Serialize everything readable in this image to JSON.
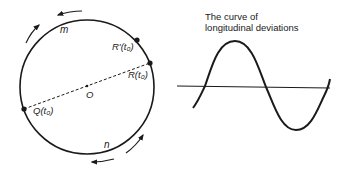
{
  "figure": {
    "circle": {
      "center": {
        "x": 87,
        "y": 87
      },
      "radius": 67,
      "center_label": "O",
      "upper_arc_label": "m",
      "lower_arc_label": "n",
      "points": [
        {
          "id": "R_prime",
          "label": "R'(t₀)",
          "x": 137,
          "y": 40
        },
        {
          "id": "R",
          "label": "R(t₀)",
          "x": 150,
          "y": 63
        },
        {
          "id": "Q",
          "label": "Q(t₀)",
          "x": 24,
          "y": 109
        }
      ],
      "diameter": {
        "from": "Q",
        "to": "R",
        "style": "dashed"
      },
      "arrows": [
        {
          "location": "upper-left",
          "direction": "counterclockwise"
        },
        {
          "location": "top",
          "direction": "counterclockwise"
        },
        {
          "location": "lower-right",
          "direction": "counterclockwise"
        },
        {
          "location": "bottom",
          "direction": "counterclockwise"
        }
      ]
    },
    "curve": {
      "title_line1": "The curve of",
      "title_line2": "longitudinal deviations",
      "axis": {
        "x1": 177,
        "x2": 330,
        "y": 87
      },
      "shape": "sine",
      "peak_y": 41,
      "trough_y": 130
    }
  },
  "colors": {
    "stroke": "#1a1a1a",
    "background": "#ffffff"
  }
}
